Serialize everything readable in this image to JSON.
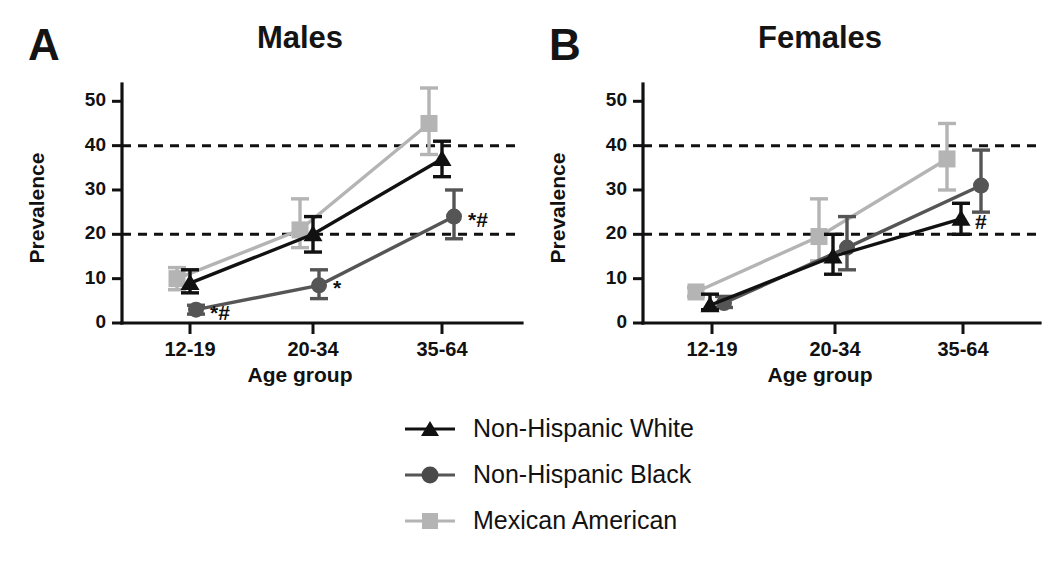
{
  "figure": {
    "background_color": "#ffffff",
    "panels": [
      {
        "letter": "A",
        "title": "Males",
        "xlabel": "Age group",
        "ylabel": "Prevalence"
      },
      {
        "letter": "B",
        "title": "Females",
        "xlabel": "Age group",
        "ylabel": "Prevalence"
      }
    ]
  },
  "legend": {
    "position": "bottom-center",
    "entries": [
      {
        "label": "Non-Hispanic White",
        "marker": "triangle",
        "color": "#111111"
      },
      {
        "label": "Non-Hispanic Black",
        "marker": "circle",
        "color": "#555555"
      },
      {
        "label": "Mexican American",
        "marker": "square",
        "color": "#b4b4b4"
      }
    ]
  },
  "chart_data": [
    {
      "type": "line",
      "title": "Males",
      "panel": "A",
      "xlabel": "Age group",
      "ylabel": "Prevalence",
      "categories": [
        "12-19",
        "20-34",
        "35-64"
      ],
      "yticks": [
        0,
        10,
        20,
        30,
        40,
        50
      ],
      "ylim": [
        0,
        53
      ],
      "grid": false,
      "reference_lines": [
        20,
        40
      ],
      "reference_line_style": "dashed",
      "legend_position": "below-figure",
      "series": [
        {
          "name": "Non-Hispanic White",
          "marker": "triangle",
          "color": "#111111",
          "values": [
            9.0,
            20.0,
            37.0
          ],
          "err_low": [
            6.8,
            16.0,
            33.0
          ],
          "err_high": [
            12.0,
            24.0,
            41.0
          ],
          "annotations": [
            "",
            "",
            ""
          ]
        },
        {
          "name": "Non-Hispanic Black",
          "marker": "circle",
          "color": "#555555",
          "values": [
            3.0,
            8.5,
            24.0
          ],
          "err_low": [
            2.0,
            5.5,
            19.0
          ],
          "err_high": [
            4.0,
            12.0,
            30.0
          ],
          "annotations": [
            "*#",
            "*",
            "*#"
          ]
        },
        {
          "name": "Mexican American",
          "marker": "square",
          "color": "#b4b4b4",
          "values": [
            10.0,
            21.0,
            45.0
          ],
          "err_low": [
            7.5,
            17.0,
            38.0
          ],
          "err_high": [
            12.5,
            28.0,
            53.0
          ],
          "annotations": [
            "",
            "",
            ""
          ]
        }
      ]
    },
    {
      "type": "line",
      "title": "Females",
      "panel": "B",
      "xlabel": "Age group",
      "ylabel": "Prevalence",
      "categories": [
        "12-19",
        "20-34",
        "35-64"
      ],
      "yticks": [
        0,
        10,
        20,
        30,
        40,
        50
      ],
      "ylim": [
        0,
        53
      ],
      "grid": false,
      "reference_lines": [
        20,
        40
      ],
      "reference_line_style": "dashed",
      "legend_position": "below-figure",
      "series": [
        {
          "name": "Non-Hispanic White",
          "marker": "triangle",
          "color": "#111111",
          "values": [
            4.0,
            15.0,
            23.5
          ],
          "err_low": [
            3.0,
            11.0,
            20.0
          ],
          "err_high": [
            6.5,
            20.0,
            27.0
          ],
          "annotations": [
            "",
            "",
            "#"
          ]
        },
        {
          "name": "Non-Hispanic Black",
          "marker": "circle",
          "color": "#555555",
          "values": [
            4.5,
            17.0,
            31.0
          ],
          "err_low": [
            3.5,
            12.0,
            25.0
          ],
          "err_high": [
            6.0,
            24.0,
            39.0
          ],
          "annotations": [
            "",
            "",
            ""
          ]
        },
        {
          "name": "Mexican American",
          "marker": "square",
          "color": "#b4b4b4",
          "values": [
            7.0,
            19.5,
            37.0
          ],
          "err_low": [
            6.0,
            14.0,
            30.0
          ],
          "err_high": [
            8.0,
            28.0,
            45.0
          ],
          "annotations": [
            "",
            "",
            ""
          ]
        }
      ]
    }
  ]
}
